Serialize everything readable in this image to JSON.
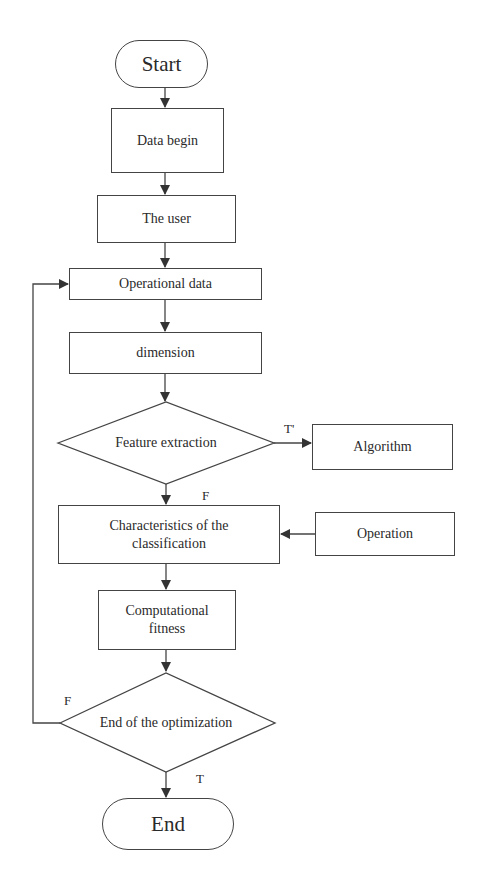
{
  "flowchart": {
    "start": "Start",
    "data_begin": "Data begin",
    "the_user": "The user",
    "operational_data": "Operational data",
    "dimension": "dimension",
    "feature_extraction": "Feature extraction",
    "algorithm": "Algorithm",
    "characteristics": "Characteristics of the classification",
    "operation": "Operation",
    "computational_fitness": "Computational fitness",
    "end_optimization": "End of the optimization",
    "end": "End",
    "labels": {
      "feature_true": "T'",
      "feature_false": "F",
      "opt_false": "F",
      "opt_true": "T"
    }
  }
}
